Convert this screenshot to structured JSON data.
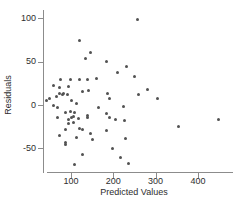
{
  "chart_data": {
    "type": "scatter",
    "title": "",
    "xlabel": "Predicted Values",
    "ylabel": "Residuals",
    "x_ticks": [
      100,
      200,
      300,
      400
    ],
    "y_ticks": [
      100,
      50,
      0,
      -50
    ],
    "xlim": [
      46,
      483
    ],
    "ylim": [
      -77,
      110
    ],
    "grid": false,
    "legend": "none",
    "point_color": "#525252",
    "axis_color": "#8c8c8c",
    "text_color": "#2e2e2e",
    "background_color": "#ffffff",
    "points": [
      [
        258,
        99
      ],
      [
        119,
        75
      ],
      [
        147,
        61
      ],
      [
        135,
        54
      ],
      [
        185,
        50
      ],
      [
        232,
        44
      ],
      [
        209,
        38
      ],
      [
        249,
        33
      ],
      [
        74,
        30
      ],
      [
        98,
        30
      ],
      [
        121,
        29
      ],
      [
        140,
        30
      ],
      [
        161,
        31
      ],
      [
        58,
        23
      ],
      [
        72,
        20
      ],
      [
        93,
        21
      ],
      [
        128,
        16
      ],
      [
        142,
        17
      ],
      [
        65,
        10
      ],
      [
        72,
        13
      ],
      [
        79,
        12
      ],
      [
        83,
        13
      ],
      [
        91,
        12
      ],
      [
        43,
        5
      ],
      [
        50,
        7
      ],
      [
        102,
        5
      ],
      [
        114,
        2
      ],
      [
        58,
        -1
      ],
      [
        67,
        -3
      ],
      [
        88,
        -9
      ],
      [
        98,
        -8
      ],
      [
        105,
        -13
      ],
      [
        109,
        -9
      ],
      [
        140,
        -12
      ],
      [
        187,
        13
      ],
      [
        190,
        8
      ],
      [
        260,
        12
      ],
      [
        164,
        -3
      ],
      [
        223,
        -2
      ],
      [
        183,
        -10
      ],
      [
        69,
        -14
      ],
      [
        95,
        -17
      ],
      [
        102,
        -15
      ],
      [
        105,
        -20
      ],
      [
        93,
        -21
      ],
      [
        117,
        -16
      ],
      [
        140,
        -15
      ],
      [
        86,
        -28
      ],
      [
        121,
        -27
      ],
      [
        128,
        -28
      ],
      [
        72,
        -35
      ],
      [
        112,
        -38
      ],
      [
        145,
        -33
      ],
      [
        192,
        -14
      ],
      [
        206,
        -17
      ],
      [
        227,
        -18
      ],
      [
        183,
        -29
      ],
      [
        230,
        -39
      ],
      [
        199,
        -50
      ],
      [
        282,
        18
      ],
      [
        305,
        8
      ],
      [
        355,
        -25
      ],
      [
        449,
        -17
      ],
      [
        86,
        -43
      ],
      [
        86,
        -46
      ],
      [
        150,
        -40
      ],
      [
        128,
        -57
      ],
      [
        216,
        -61
      ],
      [
        237,
        -67
      ],
      [
        109,
        -69
      ]
    ]
  }
}
